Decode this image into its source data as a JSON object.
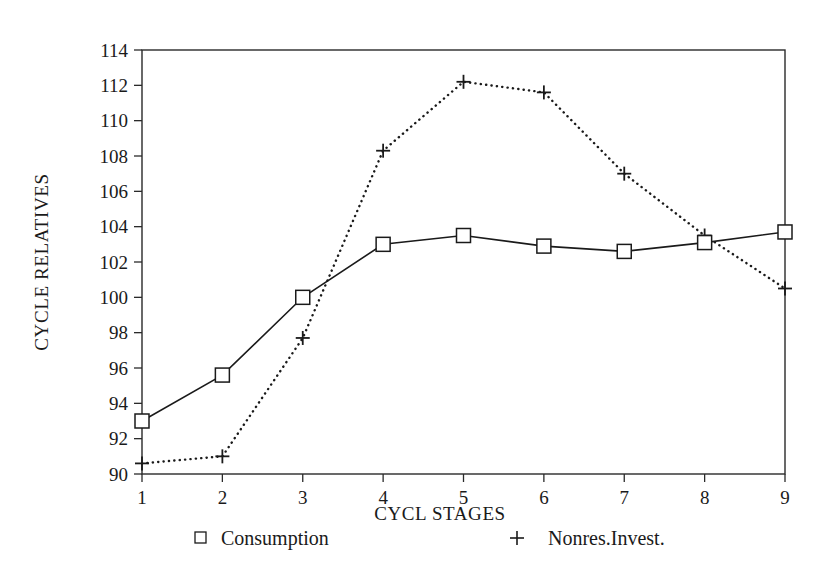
{
  "chart_data": {
    "type": "line",
    "title": "",
    "xlabel": "CYCL STAGES",
    "ylabel": "CYCLE RELATIVES",
    "x": [
      1,
      2,
      3,
      4,
      5,
      6,
      7,
      8,
      9
    ],
    "categories": [
      "1",
      "2",
      "3",
      "4",
      "5",
      "6",
      "7",
      "8",
      "9"
    ],
    "xlim": [
      1,
      9
    ],
    "ylim": [
      90,
      114
    ],
    "ytick_labels": [
      "90",
      "92",
      "94",
      "96",
      "98",
      "100",
      "102",
      "104",
      "106",
      "108",
      "110",
      "112",
      "114"
    ],
    "yticks": [
      90,
      92,
      94,
      96,
      98,
      100,
      102,
      104,
      106,
      108,
      110,
      112,
      114
    ],
    "xtick_labels": [
      "1",
      "2",
      "3",
      "4",
      "5",
      "6",
      "7",
      "8",
      "9"
    ],
    "grid": false,
    "legend_position": "below-axis",
    "series": [
      {
        "name": "Consumption",
        "marker": "square",
        "line_style": "solid",
        "color": "#1a1a1a",
        "values": [
          93.0,
          95.6,
          100.0,
          103.0,
          103.5,
          102.9,
          102.6,
          103.1,
          103.7
        ]
      },
      {
        "name": "Nonres.Invest.",
        "marker": "plus",
        "line_style": "dotted",
        "color": "#1a1a1a",
        "values": [
          90.6,
          91.0,
          97.7,
          108.3,
          112.2,
          111.6,
          107.0,
          103.5,
          100.5
        ]
      }
    ]
  },
  "legend": {
    "items": [
      {
        "label": "Consumption",
        "marker": "square"
      },
      {
        "label": "Nonres.Invest.",
        "marker": "plus"
      }
    ]
  },
  "axes": {
    "x_title": "CYCL STAGES",
    "y_title": "CYCLE RELATIVES"
  }
}
